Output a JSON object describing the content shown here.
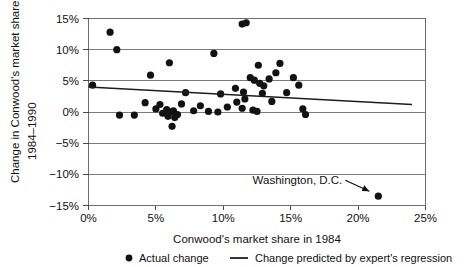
{
  "chart_data": {
    "type": "scatter",
    "title": "",
    "xlabel": "Conwood's market share in 1984",
    "ylabel": "Change in Conwood's market share 1984–1990",
    "xlim": [
      0,
      25
    ],
    "ylim": [
      -15,
      15
    ],
    "grid": true,
    "x_ticks": [
      0,
      5,
      10,
      15,
      20,
      25
    ],
    "y_ticks": [
      -15,
      -10,
      -5,
      0,
      5,
      10,
      15
    ],
    "x_tick_labels": [
      "0%",
      "5%",
      "10%",
      "15%",
      "20%",
      "25%"
    ],
    "y_tick_labels": [
      "−15%",
      "−10%",
      "−5%",
      "0%",
      "5%",
      "10%",
      "15%"
    ],
    "legend_position": "bottom",
    "legend": [
      {
        "marker": "circle",
        "label": "Actual change"
      },
      {
        "marker": "line",
        "label": "Change predicted by expert's regression"
      }
    ],
    "series": [
      {
        "name": "Actual change",
        "type": "scatter",
        "marker": "circle",
        "color": "#121212",
        "points": [
          [
            1.6,
            12.8
          ],
          [
            2.1,
            10.0
          ],
          [
            4.6,
            5.9
          ],
          [
            6.0,
            7.9
          ],
          [
            7.2,
            3.1
          ],
          [
            9.3,
            9.4
          ],
          [
            11.5,
            3.2
          ],
          [
            11.4,
            14.1
          ],
          [
            11.7,
            14.3
          ],
          [
            12.6,
            7.5
          ],
          [
            14.2,
            7.8
          ],
          [
            12.0,
            5.5
          ],
          [
            12.3,
            5.1
          ],
          [
            12.7,
            4.6
          ],
          [
            13.0,
            4.2
          ],
          [
            13.4,
            5.3
          ],
          [
            15.2,
            5.5
          ],
          [
            15.6,
            4.3
          ],
          [
            10.9,
            3.8
          ],
          [
            11.6,
            2.1
          ],
          [
            12.9,
            3.0
          ],
          [
            13.9,
            6.3
          ],
          [
            14.7,
            3.1
          ],
          [
            9.8,
            2.9
          ],
          [
            11.0,
            1.6
          ],
          [
            11.4,
            0.6
          ],
          [
            12.2,
            0.3
          ],
          [
            12.5,
            0.1
          ],
          [
            6.9,
            1.3
          ],
          [
            8.3,
            1.0
          ],
          [
            8.9,
            0.1
          ],
          [
            9.6,
            0.0
          ],
          [
            5.3,
            1.2
          ],
          [
            5.8,
            0.4
          ],
          [
            6.1,
            0.0
          ],
          [
            6.3,
            0.2
          ],
          [
            6.6,
            -0.4
          ],
          [
            5.9,
            -0.7
          ],
          [
            6.4,
            -0.9
          ],
          [
            5.5,
            -0.2
          ],
          [
            5.0,
            0.5
          ],
          [
            4.2,
            1.5
          ],
          [
            6.2,
            -2.3
          ],
          [
            2.3,
            -0.5
          ],
          [
            3.4,
            -0.5
          ],
          [
            0.3,
            4.3
          ],
          [
            15.9,
            0.5
          ],
          [
            16.1,
            -0.4
          ],
          [
            13.6,
            1.7
          ],
          [
            10.3,
            0.8
          ],
          [
            7.8,
            0.2
          ],
          [
            21.5,
            -13.5
          ]
        ]
      },
      {
        "name": "Change predicted by expert's regression",
        "type": "line",
        "color": "#1d1d1d",
        "x": [
          0,
          24
        ],
        "y": [
          4.0,
          1.2
        ]
      }
    ],
    "annotations": [
      {
        "text": "Washington, D.C.",
        "x": 21.5,
        "y": -13.5,
        "label_x": 14.0,
        "label_y": -12.2,
        "arrow": true
      }
    ]
  }
}
